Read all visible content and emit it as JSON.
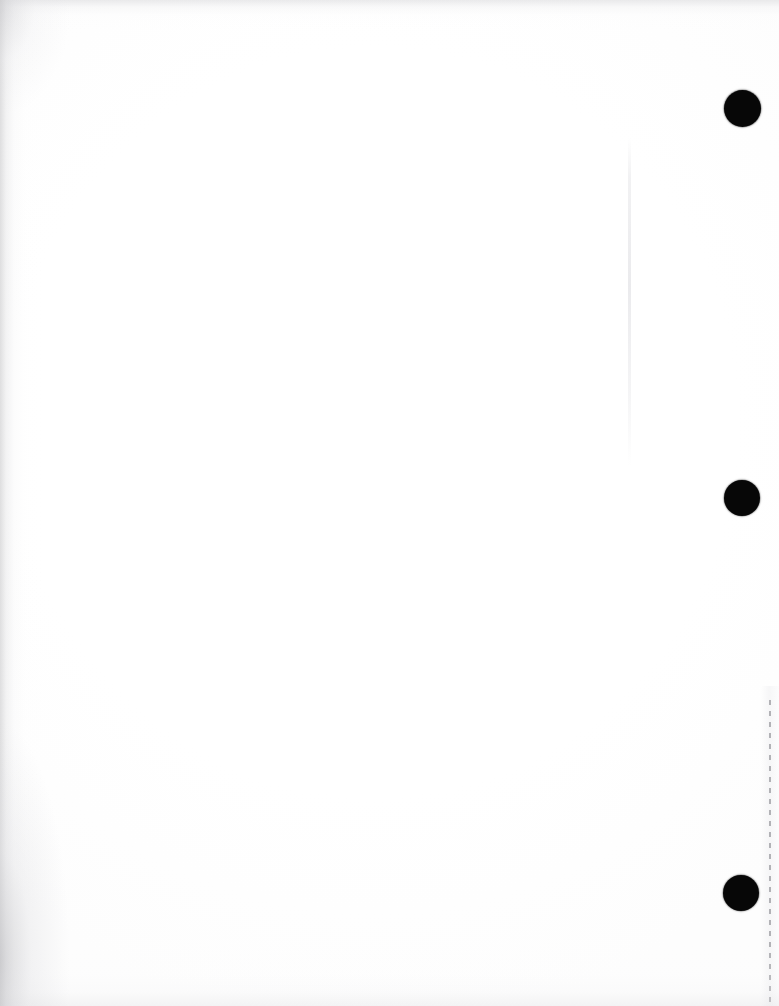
{
  "document": {
    "kind": "scanned-page",
    "page_label": "",
    "body_text": "",
    "background_color": "#ffffff",
    "paper_tone_color": "#fdfdfd",
    "scan_shadow_color": "#c4c4c6",
    "width_px": 779,
    "height_px": 1006
  },
  "marks": {
    "punch_color": "#070707",
    "punch_holes": [
      {
        "name": "punch-hole-top",
        "center_x": 742,
        "center_y": 108,
        "diameter": 37
      },
      {
        "name": "punch-hole-middle",
        "center_x": 742,
        "center_y": 498,
        "diameter": 36
      },
      {
        "name": "punch-hole-bottom",
        "center_x": 741,
        "center_y": 893,
        "diameter": 36
      }
    ],
    "perforation": {
      "name": "perforation-tear-line",
      "x": 769,
      "y_start": 700,
      "y_end": 1006,
      "dash_length": 5,
      "gap_length": 6,
      "color": "#b2b2b6"
    },
    "fold_crease": {
      "name": "fold-crease-streak",
      "x": 628,
      "y_start": 138,
      "y_end": 466,
      "width": 3,
      "color": "#e7e7ea"
    }
  },
  "edges": {
    "left_shadow_width": 44,
    "top_shadow_height": 30,
    "bottom_shadow_height": 62
  }
}
